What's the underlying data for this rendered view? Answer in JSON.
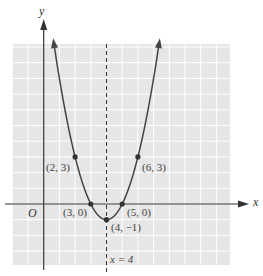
{
  "chart_data": {
    "type": "line",
    "title": "",
    "xlabel": "x",
    "ylabel": "y",
    "origin_label": "O",
    "function": "y = (x - 4)^2 - 1",
    "xlim": [
      -2,
      11.8
    ],
    "ylim": [
      -3.9,
      10.2
    ],
    "grid": true,
    "axis_of_symmetry": {
      "x": 4,
      "label": "x = 4",
      "style": "dashed"
    },
    "points": [
      {
        "x": 2,
        "y": 3,
        "label": "(2, 3)"
      },
      {
        "x": 3,
        "y": 0,
        "label": "(3, 0)"
      },
      {
        "x": 4,
        "y": -1,
        "label": "(4, −1)"
      },
      {
        "x": 5,
        "y": 0,
        "label": "(5, 0)"
      },
      {
        "x": 6,
        "y": 3,
        "label": "(6, 3)"
      }
    ],
    "vertex": {
      "x": 4,
      "y": -1
    },
    "series": [
      {
        "name": "parabola",
        "x_range": [
          0.65,
          7.35
        ],
        "color": "#444444"
      }
    ]
  },
  "colors": {
    "grid_bg": "#e6e6e6",
    "grid_line": "#ffffff",
    "axis": "#333333",
    "curve": "#444444",
    "label": "#444444"
  }
}
